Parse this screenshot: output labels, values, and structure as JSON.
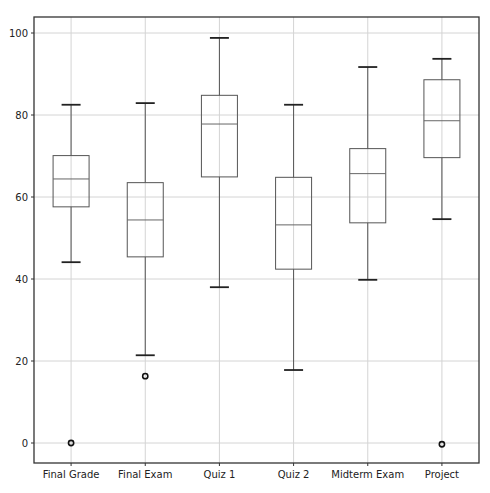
{
  "chart_data": {
    "type": "boxplot",
    "title": "",
    "xlabel": "",
    "ylabel": "",
    "ylim": [
      -5,
      103
    ],
    "yticks": [
      0,
      20,
      40,
      60,
      80,
      100
    ],
    "grid": true,
    "legend": null,
    "categories": [
      "Final Grade",
      "Final Exam",
      "Quiz 1",
      "Quiz 2",
      "Midterm Exam",
      "Project"
    ],
    "series": [
      {
        "name": "Final Grade",
        "whisker_low": 44.1,
        "q1": 57.6,
        "median": 64.4,
        "q3": 70.1,
        "whisker_high": 82.5,
        "outliers": [
          0
        ]
      },
      {
        "name": "Final Exam",
        "whisker_low": 21.4,
        "q1": 45.4,
        "median": 54.4,
        "q3": 63.5,
        "whisker_high": 82.9,
        "outliers": [
          16.3
        ]
      },
      {
        "name": "Quiz 1",
        "whisker_low": 38.0,
        "q1": 64.9,
        "median": 77.8,
        "q3": 84.8,
        "whisker_high": 98.8,
        "outliers": []
      },
      {
        "name": "Quiz 2",
        "whisker_low": 17.8,
        "q1": 42.4,
        "median": 53.2,
        "q3": 64.8,
        "whisker_high": 82.5,
        "outliers": []
      },
      {
        "name": "Midterm Exam",
        "whisker_low": 39.8,
        "q1": 53.7,
        "median": 65.7,
        "q3": 71.8,
        "whisker_high": 91.7,
        "outliers": []
      },
      {
        "name": "Project",
        "whisker_low": 54.6,
        "q1": 69.6,
        "median": 78.6,
        "q3": 88.6,
        "whisker_high": 93.7,
        "outliers": [
          -0.3
        ]
      }
    ]
  },
  "colors": {
    "box": "#555555",
    "median": "#666666",
    "cap": "#222222",
    "grid": "#d4d4d4",
    "frame": "#333333",
    "background": "#ffffff"
  }
}
